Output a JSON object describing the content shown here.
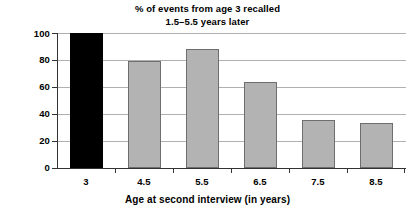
{
  "chart_data": {
    "type": "bar",
    "title": "% of events from age 3 recalled\n1.5–5.5 years later",
    "title_line1": "% of events from age 3 recalled",
    "title_line2": "1.5–5.5 years later",
    "xlabel": "Age at second interview (in years)",
    "ylabel": "% of events recalled",
    "categories": [
      "3",
      "4.5",
      "5.5",
      "6.5",
      "7.5",
      "8.5"
    ],
    "values": [
      100,
      79,
      88,
      63.5,
      35.5,
      33.5
    ],
    "ylim": [
      0,
      100
    ],
    "yticks": [
      0,
      20,
      40,
      60,
      80,
      100
    ],
    "ytick_labels": [
      "0",
      "20",
      "40",
      "60",
      "80",
      "100"
    ],
    "grid": true,
    "grid_axis": "y",
    "legend": "none",
    "bar_colors": [
      "#000000",
      "#b3b3b3",
      "#b3b3b3",
      "#b3b3b3",
      "#b3b3b3",
      "#b3b3b3"
    ],
    "bar_edge_color": "#6e6e6e",
    "grid_color": "#b0b0b0",
    "axis_color": "#333333",
    "bars": [
      {
        "category": "3",
        "value": 100,
        "color": "#000000"
      },
      {
        "category": "4.5",
        "value": 79,
        "color": "#b3b3b3"
      },
      {
        "category": "5.5",
        "value": 88,
        "color": "#b3b3b3"
      },
      {
        "category": "6.5",
        "value": 63.5,
        "color": "#b3b3b3"
      },
      {
        "category": "7.5",
        "value": 35.5,
        "color": "#b3b3b3"
      },
      {
        "category": "8.5",
        "value": 33.5,
        "color": "#b3b3b3"
      }
    ]
  }
}
